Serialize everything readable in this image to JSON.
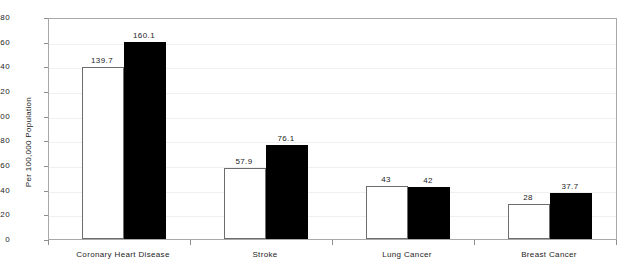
{
  "chart_data": {
    "type": "bar",
    "title": "",
    "subtitle": "",
    "xlabel": "",
    "ylabel": "Per 100,000 Population",
    "ylim": [
      0,
      180
    ],
    "ytick_step": 20,
    "yticks": [
      180,
      160,
      140,
      120,
      100,
      80,
      60,
      40,
      20,
      0
    ],
    "ytick_labels": [
      "180",
      "160",
      "140",
      "120",
      "100",
      "80",
      "60",
      "40",
      "20",
      "0"
    ],
    "grid": true,
    "legend": "none",
    "categories": [
      "Coronary Heart Disease",
      "Stroke",
      "Lung Cancer",
      "Breast Cancer"
    ],
    "series": [
      {
        "name": "series-white",
        "style": "white-filled-outlined",
        "color": "#ffffff",
        "edge_color": "#6d6d6d",
        "values": [
          139.7,
          57.9,
          43,
          28
        ],
        "labels": [
          "139.7",
          "57.9",
          "43",
          "28"
        ]
      },
      {
        "name": "series-black",
        "style": "black-filled",
        "color": "#000000",
        "edge_color": "#000000",
        "values": [
          160.1,
          76.1,
          42,
          37.7
        ],
        "labels": [
          "160.1",
          "76.1",
          "42",
          "37.7"
        ]
      }
    ],
    "colors": {
      "plot_border": "#a8a8a8",
      "gridline": "#f0f0f0",
      "tick": "#8e8e8e",
      "text": "#1d1d1d",
      "background": "#ffffff"
    }
  }
}
